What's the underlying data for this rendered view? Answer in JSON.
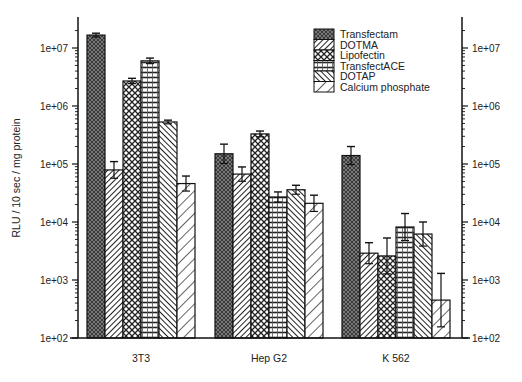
{
  "chart_data": {
    "type": "bar",
    "title": "",
    "xlabel": "",
    "ylabel": "RLU / 10 sec / mg protein",
    "yscale": "log",
    "ylim": [
      100,
      30000000
    ],
    "y_ticks": [
      "1e+02",
      "1e+03",
      "1e+04",
      "1e+05",
      "1e+06",
      "1e+07"
    ],
    "y_tick_values": [
      100,
      1000,
      10000,
      100000,
      1000000,
      10000000
    ],
    "grid": false,
    "legend_position": "upper right (inside)",
    "categories": [
      "3T3",
      "Hep G2",
      "K 562"
    ],
    "series": [
      {
        "name": "Transfectam",
        "pattern": "dense-crosshatch-dark",
        "values": [
          16700000,
          150000,
          140000
        ],
        "error_upper": [
          18000000,
          220000,
          200000
        ]
      },
      {
        "name": "DOTMA",
        "pattern": "diagonal-right-fine",
        "values": [
          79000,
          67000,
          2900
        ],
        "error_upper": [
          110000,
          89000,
          4400
        ]
      },
      {
        "name": "Lipofectin",
        "pattern": "diamond-crosshatch",
        "values": [
          2700000,
          330000,
          2600
        ],
        "error_upper": [
          3000000,
          370000,
          5300
        ]
      },
      {
        "name": "TransfectACE",
        "pattern": "grid-dots",
        "values": [
          6000000,
          27000,
          8200
        ],
        "error_upper": [
          6700000,
          33000,
          14000
        ]
      },
      {
        "name": "DOTAP",
        "pattern": "diagonal-left-fine",
        "values": [
          530000,
          36000,
          6200
        ],
        "error_upper": [
          570000,
          43000,
          10000
        ]
      },
      {
        "name": "Calcium phosphate",
        "pattern": "diagonal-right-wide",
        "values": [
          46000,
          21000,
          450
        ],
        "error_upper": [
          62000,
          29000,
          1300
        ]
      }
    ]
  },
  "axes": {
    "left_ticks": [
      "1e+07",
      "1e+06",
      "1e+05",
      "1e+04",
      "1e+03",
      "1e+02"
    ],
    "right_ticks": [
      "1e+07",
      "1e+06",
      "1e+05",
      "1e+04",
      "1e+03",
      "1e+02"
    ],
    "ylabel": "RLU / 10 sec / mg protein"
  },
  "legend": {
    "items": [
      "Transfectam",
      "DOTMA",
      "Lipofectin",
      "TransfectACE",
      "DOTAP",
      "Calcium phosphate"
    ]
  },
  "x_labels": [
    "3T3",
    "Hep G2",
    "K 562"
  ]
}
